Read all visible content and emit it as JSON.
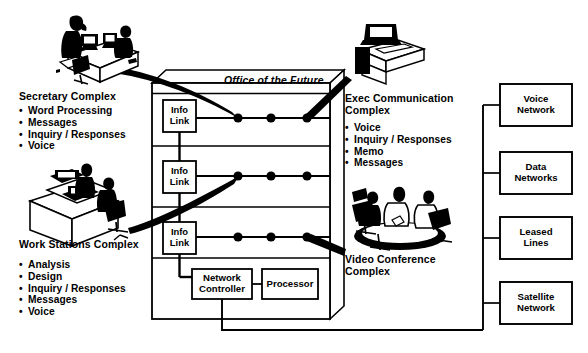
{
  "diagram": {
    "title_banner": "Office of the Future",
    "accent_color": "#000000",
    "background_color": "#ffffff"
  },
  "left_groups": [
    {
      "id": "secretary",
      "heading": "Secretary Complex",
      "items": [
        "Word Processing",
        "Messages",
        "Inquiry / Responses",
        "Voice"
      ]
    },
    {
      "id": "work-stations",
      "heading": "Work Stations Complex",
      "items": [
        "Analysis",
        "Design",
        "Inquiry / Responses",
        "Messages",
        "Voice"
      ]
    }
  ],
  "right_groups": [
    {
      "id": "exec-communication",
      "heading_line1": "Exec Communication",
      "heading_line2": "Complex",
      "items": [
        "Voice",
        "Inquiry / Responses",
        "Memo",
        "Messages"
      ]
    },
    {
      "id": "video-conference",
      "heading_line1": "Video Conference",
      "heading_line2": "Complex",
      "items": []
    }
  ],
  "info_links": [
    {
      "line1": "Info",
      "line2": "Link"
    },
    {
      "line1": "Info",
      "line2": "Link"
    },
    {
      "line1": "Info",
      "line2": "Link"
    }
  ],
  "core_boxes": [
    {
      "id": "network-controller",
      "line1": "Network",
      "line2": "Controller"
    },
    {
      "id": "processor",
      "line1": "Processor",
      "line2": ""
    }
  ],
  "networks": [
    {
      "id": "voice-network",
      "line1": "Voice",
      "line2": "Network"
    },
    {
      "id": "data-networks",
      "line1": "Data",
      "line2": "Networks"
    },
    {
      "id": "leased-lines",
      "line1": "Leased",
      "line2": "Lines"
    },
    {
      "id": "satellite-network",
      "line1": "Satellite",
      "line2": "Network"
    }
  ],
  "bus_rows": [
    {
      "row": 1,
      "node_count": 3
    },
    {
      "row": 2,
      "node_count": 3
    },
    {
      "row": 3,
      "node_count": 3
    }
  ]
}
